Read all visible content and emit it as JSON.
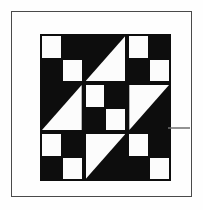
{
  "figure": {
    "canvas_width": 203,
    "canvas_height": 210,
    "background_color": "#fefefe"
  },
  "frame": {
    "name": "outer-border-rule",
    "color": "#4a4a4a",
    "thickness": 1
  },
  "quilt_block": {
    "name": "jacobs-ladder-block",
    "grid_rows": 3,
    "grid_columns": 3,
    "dark_color": "#0d0d0d",
    "light_color": "#fcfcfc",
    "sashing_color": "#0d0d0d",
    "cells": [
      {
        "position": "top-left",
        "type": "four-patch",
        "patches": [
          "light",
          "dark",
          "dark",
          "light"
        ]
      },
      {
        "position": "top-center",
        "type": "half-square-triangle",
        "light_half": "lower-right",
        "diagonal": "top-left-to-bottom-right"
      },
      {
        "position": "top-right",
        "type": "four-patch",
        "patches": [
          "light",
          "dark",
          "dark",
          "light"
        ]
      },
      {
        "position": "middle-left",
        "type": "half-square-triangle",
        "light_half": "lower-right",
        "diagonal": "top-left-to-bottom-right"
      },
      {
        "position": "center",
        "type": "four-patch",
        "patches": [
          "light",
          "dark",
          "dark",
          "light"
        ]
      },
      {
        "position": "middle-right",
        "type": "half-square-triangle",
        "light_half": "upper-left",
        "diagonal": "top-right-to-bottom-left"
      },
      {
        "position": "bottom-left",
        "type": "four-patch",
        "patches": [
          "light",
          "dark",
          "dark",
          "light"
        ]
      },
      {
        "position": "bottom-center",
        "type": "half-square-triangle",
        "light_half": "upper-left",
        "diagonal": "top-right-to-bottom-left"
      },
      {
        "position": "bottom-right",
        "type": "four-patch",
        "patches": [
          "light",
          "dark",
          "dark",
          "light"
        ]
      }
    ]
  },
  "artifacts": {
    "edge_mark": {
      "name": "scan-artifact-mark",
      "color": "#6d6d6d"
    }
  }
}
